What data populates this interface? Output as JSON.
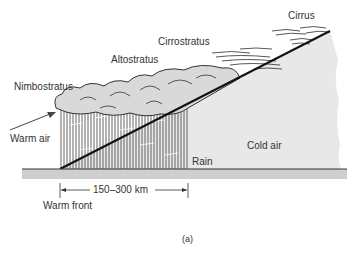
{
  "figure": {
    "panel_label": "(a)",
    "labels": {
      "cirrus": "Cirrus",
      "cirrostratus": "Cirrostratus",
      "altostratus": "Altostratus",
      "nimbostratus": "Nimbostratus",
      "warm_air": "Warm air",
      "cold_air": "Cold air",
      "rain": "Rain",
      "distance": "150–300 km",
      "warm_front": "Warm front"
    },
    "colors": {
      "cold_air_fill": "#e8e8e8",
      "cloud_fill": "#d9d9d9",
      "ground_fill": "#cfcfcf",
      "front_line": "#111111",
      "rain_hatch": "#555555",
      "text": "#333333"
    }
  }
}
